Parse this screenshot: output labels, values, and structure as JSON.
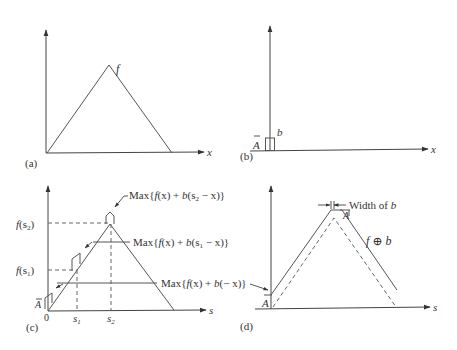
{
  "figure": {
    "panels": [
      {
        "id": "a",
        "caption": "(a)",
        "function_label": "f",
        "x_axis_label": "x"
      },
      {
        "id": "b",
        "caption": "(b)",
        "structuring_element_label": "b",
        "height_label": "A",
        "x_axis_label": "x"
      },
      {
        "id": "c",
        "caption": "(c)",
        "x_axis_label": "s",
        "origin_label": "0",
        "height_label": "A",
        "y_ticks": [
          "f(s2)",
          "f(s1)"
        ],
        "x_ticks": [
          "s1",
          "s2"
        ],
        "annotations": [
          "Max{f(x) + b(s2 − x)}",
          "Max{f(x) + b(s1 − x)}",
          "Max{f(x) + b(− x)}"
        ]
      },
      {
        "id": "d",
        "caption": "(d)",
        "x_axis_label": "s",
        "height_label": "A",
        "result_label": "f ⊕ b",
        "width_annotation": "Width of b",
        "peak_label": "A"
      }
    ]
  },
  "text": {
    "a_caption": "(a)",
    "a_f": "f",
    "a_x": "x",
    "b_caption": "(b)",
    "b_b": "b",
    "b_A": "A",
    "b_x": "x",
    "c_caption": "(c)",
    "c_s": "s",
    "c_zero": "0",
    "c_A": "A",
    "c_fs2_f": "f",
    "c_fs2_arg": "(s",
    "c_fs2_sub": "2",
    "c_fs2_close": ")",
    "c_fs1_f": "f",
    "c_fs1_arg": "(s",
    "c_fs1_sub": "1",
    "c_fs1_close": ")",
    "c_s1": "s",
    "c_s1_sub": "1",
    "c_s2": "s",
    "c_s2_sub": "2",
    "max_word": "Max{",
    "ann1_f": "f",
    "ann1_mid": "(x) + ",
    "ann1_b": "b",
    "ann1_arg": "(s",
    "ann1_sub": "2",
    "ann1_end": " − x)}",
    "ann2_sub": "1",
    "ann3_end": "(− x)}",
    "d_caption": "(d)",
    "d_s": "s",
    "d_A": "A",
    "d_A_peak": "A",
    "d_width": "Width of ",
    "d_width_b": "b",
    "d_result_f": "f",
    "d_result_op": " ⊕ ",
    "d_result_b": "b"
  }
}
